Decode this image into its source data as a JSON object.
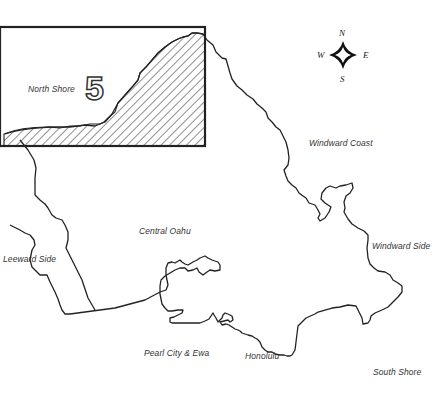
{
  "map": {
    "highlighted_zone": {
      "number": "5",
      "name": "North Shore"
    },
    "regions": [
      {
        "label": "North Shore"
      },
      {
        "label": "Windward Coast"
      },
      {
        "label": "Central Oahu"
      },
      {
        "label": "Windward Side"
      },
      {
        "label": "Leeward Side"
      },
      {
        "label": "Pearl City & Ewa"
      },
      {
        "label": "Honolulu"
      },
      {
        "label": "South Shore"
      }
    ],
    "compass": {
      "north": "N",
      "south": "S",
      "east": "E",
      "west": "W"
    },
    "colors": {
      "outline": "#222222",
      "hatch": "#333333",
      "background": "#ffffff"
    }
  }
}
